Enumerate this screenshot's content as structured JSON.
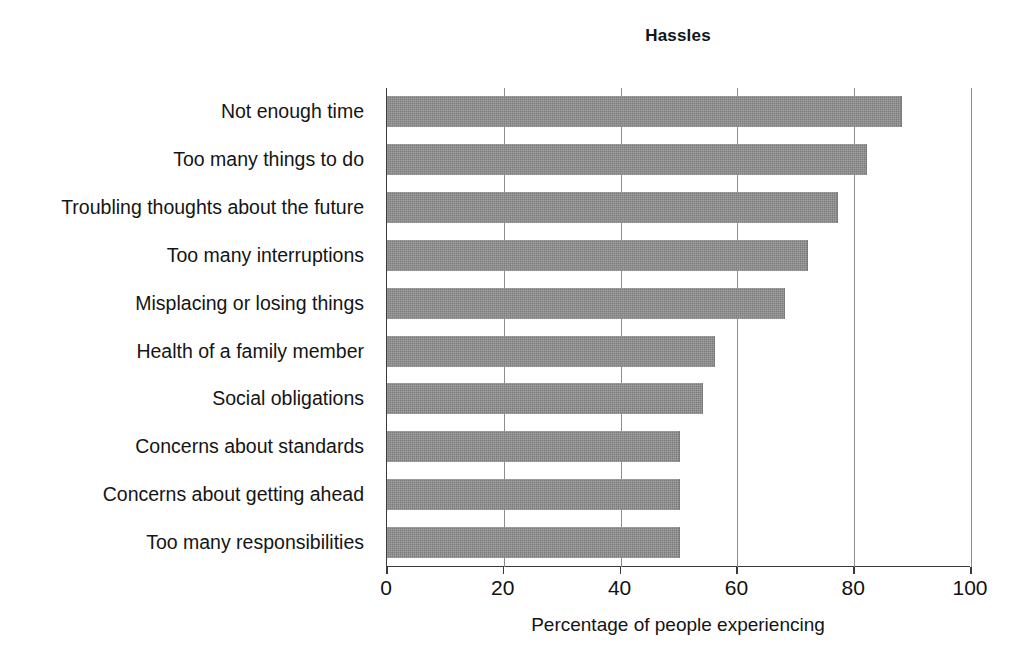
{
  "chart_data": {
    "type": "bar",
    "orientation": "horizontal",
    "title": "Hassles",
    "xlabel": "Percentage of people experiencing",
    "ylabel": "",
    "xlim": [
      0,
      100
    ],
    "xticks": [
      0,
      20,
      40,
      60,
      80,
      100
    ],
    "xtick_labels": [
      "0",
      "20",
      "40",
      "60",
      "80",
      "100"
    ],
    "grid": "vertical",
    "legend": "none",
    "bar_color": "#8a8a8a",
    "categories": [
      "Not enough time",
      "Too many things to do",
      "Troubling thoughts about the future",
      "Too many interruptions",
      "Misplacing or losing things",
      "Health of a family member",
      "Social obligations",
      "Concerns about standards",
      "Concerns about getting ahead",
      "Too many responsibilities"
    ],
    "values": [
      88,
      82,
      77,
      72,
      68,
      56,
      54,
      50,
      50,
      50
    ]
  }
}
